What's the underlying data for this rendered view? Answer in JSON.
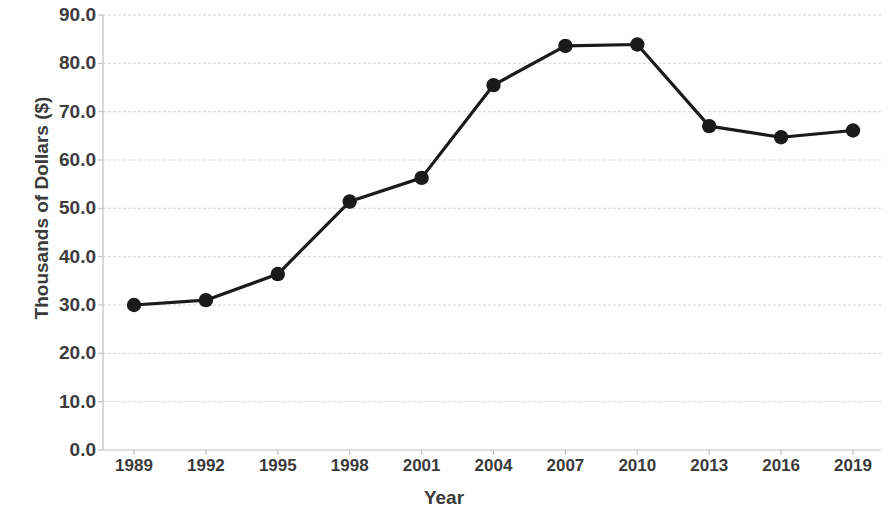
{
  "chart_data": {
    "type": "line",
    "title": "",
    "xlabel": "Year",
    "ylabel": "Thousands of Dollars ($)",
    "categories": [
      "1989",
      "1992",
      "1995",
      "1998",
      "2001",
      "2004",
      "2007",
      "2010",
      "2013",
      "2016",
      "2019"
    ],
    "values": [
      30.0,
      31.0,
      36.4,
      51.4,
      56.3,
      75.5,
      83.6,
      83.9,
      67.0,
      64.7,
      66.1
    ],
    "series": [
      {
        "name": "",
        "values": [
          30.0,
          31.0,
          36.4,
          51.4,
          56.3,
          75.5,
          83.6,
          83.9,
          67.0,
          64.7,
          66.1
        ]
      }
    ],
    "ylim": [
      0.0,
      90.0
    ],
    "ytick_labels": [
      "90.0",
      "80.0",
      "70.0",
      "60.0",
      "50.0",
      "40.0",
      "30.0",
      "20.0",
      "10.0",
      "0.0"
    ],
    "ytick_values": [
      90.0,
      80.0,
      70.0,
      60.0,
      50.0,
      40.0,
      30.0,
      20.0,
      10.0,
      0.0
    ],
    "xtick_labels": [
      "1989",
      "1992",
      "1995",
      "1998",
      "2001",
      "2004",
      "2007",
      "2010",
      "2013",
      "2016",
      "2019"
    ],
    "grid": "horizontal-dashed",
    "legend": "none",
    "line_color": "#1a1a1a",
    "marker_color": "#1a1a1a",
    "marker_shape": "circle",
    "grid_color": "#d9d9d9",
    "axis_color": "#bfbfbf",
    "text_color": "#3b3b3b",
    "background": "#ffffff"
  }
}
